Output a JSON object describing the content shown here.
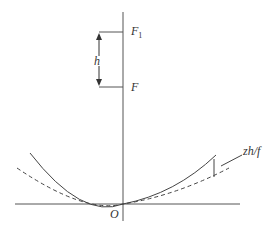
{
  "diagram": {
    "labels": {
      "f1": "F",
      "f1_sub": "1",
      "f": "F",
      "h": "h",
      "origin": "O",
      "deflection": "zh/f"
    },
    "colors": {
      "line": "#444444",
      "background": "#ffffff"
    }
  }
}
